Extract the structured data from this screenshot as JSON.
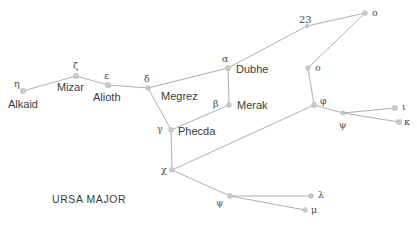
{
  "diagram": {
    "title": "URSA MAJOR",
    "constellation_label": "URSA MAJOR",
    "background_color": "#ffffff",
    "star_color": "#c9c9c9",
    "line_color": "#9a9a9a",
    "text_color": "#3a3a3a"
  },
  "chart_data": {
    "type": "scatter",
    "title": "URSA MAJOR",
    "xlabel": "",
    "ylabel": "",
    "grid": false,
    "legend": false,
    "xlim": [
      0,
      417
    ],
    "ylim": [
      0,
      227
    ],
    "stars": [
      {
        "id": "eta",
        "greek": "η",
        "proper": "Alkaid",
        "x": 23,
        "y": 91,
        "r": 2.2,
        "shape": "square"
      },
      {
        "id": "zeta",
        "greek": "ζ",
        "proper": "Mizar",
        "x": 76,
        "y": 76,
        "r": 2.2,
        "shape": "square"
      },
      {
        "id": "epsilon",
        "greek": "ε",
        "proper": "Alioth",
        "x": 108,
        "y": 85,
        "r": 2.2,
        "shape": "square"
      },
      {
        "id": "delta",
        "greek": "δ",
        "proper": "Megrez",
        "x": 148,
        "y": 88,
        "r": 2.4,
        "shape": "circle"
      },
      {
        "id": "alpha",
        "greek": "α",
        "proper": "Dubhe",
        "x": 228,
        "y": 68,
        "r": 2.6,
        "shape": "circle"
      },
      {
        "id": "beta",
        "greek": "β",
        "proper": "Merak",
        "x": 229,
        "y": 105,
        "r": 2.4,
        "shape": "circle"
      },
      {
        "id": "gamma",
        "greek": "γ",
        "proper": "Phecda",
        "x": 171,
        "y": 130,
        "r": 2.4,
        "shape": "circle"
      },
      {
        "id": "chi",
        "greek": "χ",
        "proper": "",
        "x": 172,
        "y": 170,
        "r": 2.4,
        "shape": "circle"
      },
      {
        "id": "star23",
        "greek": "23",
        "proper": "",
        "x": 307,
        "y": 26,
        "r": 1.9,
        "shape": "circle"
      },
      {
        "id": "omicron1",
        "greek": "o",
        "proper": "",
        "x": 365,
        "y": 13,
        "r": 2.4,
        "shape": "circle"
      },
      {
        "id": "omicron2",
        "greek": "o",
        "proper": "",
        "x": 308,
        "y": 68,
        "r": 2.4,
        "shape": "circle"
      },
      {
        "id": "phi",
        "greek": "φ",
        "proper": "",
        "x": 314,
        "y": 105,
        "r": 2.6,
        "shape": "circle"
      },
      {
        "id": "upsilon",
        "greek": "ψ",
        "proper": "",
        "x": 343,
        "y": 113,
        "r": 2.2,
        "shape": "circle"
      },
      {
        "id": "iota",
        "greek": "ι",
        "proper": "",
        "x": 395,
        "y": 108,
        "r": 2.2,
        "shape": "square"
      },
      {
        "id": "kappa",
        "greek": "κ",
        "proper": "",
        "x": 399,
        "y": 122,
        "r": 2.2,
        "shape": "square"
      },
      {
        "id": "psi",
        "greek": "ψ",
        "proper": "",
        "x": 230,
        "y": 196,
        "r": 2.4,
        "shape": "circle"
      },
      {
        "id": "lambda",
        "greek": "λ",
        "proper": "",
        "x": 311,
        "y": 196,
        "r": 2.4,
        "shape": "circle"
      },
      {
        "id": "mu",
        "greek": "μ",
        "proper": "",
        "x": 305,
        "y": 210,
        "r": 2.4,
        "shape": "circle"
      }
    ],
    "links": [
      {
        "from": "eta",
        "to": "zeta"
      },
      {
        "from": "zeta",
        "to": "epsilon"
      },
      {
        "from": "epsilon",
        "to": "delta"
      },
      {
        "from": "delta",
        "to": "alpha"
      },
      {
        "from": "alpha",
        "to": "beta"
      },
      {
        "from": "beta",
        "to": "gamma"
      },
      {
        "from": "gamma",
        "to": "delta"
      },
      {
        "from": "gamma",
        "to": "chi"
      },
      {
        "from": "alpha",
        "to": "star23"
      },
      {
        "from": "star23",
        "to": "omicron1"
      },
      {
        "from": "omicron1",
        "to": "omicron2"
      },
      {
        "from": "omicron2",
        "to": "phi"
      },
      {
        "from": "phi",
        "to": "chi"
      },
      {
        "from": "phi",
        "to": "upsilon"
      },
      {
        "from": "upsilon",
        "to": "iota"
      },
      {
        "from": "upsilon",
        "to": "kappa"
      },
      {
        "from": "chi",
        "to": "psi"
      },
      {
        "from": "psi",
        "to": "lambda"
      },
      {
        "from": "psi",
        "to": "mu"
      }
    ],
    "labels": [
      {
        "id": "lbl-eta",
        "text": "η",
        "x": 14,
        "y": 79,
        "cls": "greek"
      },
      {
        "id": "lbl-alkaid",
        "text": "Alkaid",
        "x": 8,
        "y": 99,
        "cls": "proper"
      },
      {
        "id": "lbl-zeta",
        "text": "ζ",
        "x": 73,
        "y": 61,
        "cls": "greek"
      },
      {
        "id": "lbl-mizar",
        "text": "Mizar",
        "x": 57,
        "y": 82,
        "cls": "proper"
      },
      {
        "id": "lbl-epsilon",
        "text": "ε",
        "x": 104,
        "y": 71,
        "cls": "greek"
      },
      {
        "id": "lbl-alioth",
        "text": "Alioth",
        "x": 93,
        "y": 92,
        "cls": "proper"
      },
      {
        "id": "lbl-delta",
        "text": "δ",
        "x": 144,
        "y": 74,
        "cls": "greek"
      },
      {
        "id": "lbl-megrez",
        "text": "Megrez",
        "x": 161,
        "y": 91,
        "cls": "proper"
      },
      {
        "id": "lbl-alpha",
        "text": "α",
        "x": 222,
        "y": 54,
        "cls": "greek"
      },
      {
        "id": "lbl-dubhe",
        "text": "Dubhe",
        "x": 236,
        "y": 64,
        "cls": "proper"
      },
      {
        "id": "lbl-beta",
        "text": "β",
        "x": 213,
        "y": 99,
        "cls": "greek"
      },
      {
        "id": "lbl-merak",
        "text": "Merak",
        "x": 237,
        "y": 100,
        "cls": "proper"
      },
      {
        "id": "lbl-gamma",
        "text": "γ",
        "x": 157,
        "y": 124,
        "cls": "greek"
      },
      {
        "id": "lbl-phecda",
        "text": "Phecda",
        "x": 178,
        "y": 126,
        "cls": "proper"
      },
      {
        "id": "lbl-chi",
        "text": "χ",
        "x": 161,
        "y": 165,
        "cls": "greek"
      },
      {
        "id": "lbl-23",
        "text": "23",
        "x": 299,
        "y": 15,
        "cls": "num"
      },
      {
        "id": "lbl-omicron1",
        "text": "o",
        "x": 372,
        "y": 8,
        "cls": "greek"
      },
      {
        "id": "lbl-omicron2",
        "text": "o",
        "x": 315,
        "y": 63,
        "cls": "greek"
      },
      {
        "id": "lbl-phi",
        "text": "φ",
        "x": 320,
        "y": 96,
        "cls": "greek"
      },
      {
        "id": "lbl-upsilon",
        "text": "ψ",
        "x": 339,
        "y": 120,
        "cls": "greek"
      },
      {
        "id": "lbl-iota",
        "text": "ι",
        "x": 402,
        "y": 102,
        "cls": "greek"
      },
      {
        "id": "lbl-kappa",
        "text": "κ",
        "x": 404,
        "y": 117,
        "cls": "greek"
      },
      {
        "id": "lbl-psi",
        "text": "ψ",
        "x": 216,
        "y": 198,
        "cls": "greek"
      },
      {
        "id": "lbl-lambda",
        "text": "λ",
        "x": 318,
        "y": 190,
        "cls": "greek"
      },
      {
        "id": "lbl-mu",
        "text": "μ",
        "x": 311,
        "y": 205,
        "cls": "greek"
      },
      {
        "id": "lbl-constell",
        "text": "URSA MAJOR",
        "x": 52,
        "y": 194,
        "cls": "constellation"
      }
    ]
  }
}
